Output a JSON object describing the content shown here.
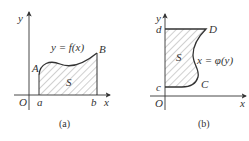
{
  "panel_a": {
    "caption": "(a)",
    "origin_label": "O",
    "x_axis_label": "x",
    "y_axis_label": "y",
    "point_a_label": "a",
    "point_b_label": "b",
    "curve_start_label": "A",
    "curve_end_label": "B",
    "function_label": "y = f(x)",
    "region_label": "S"
  },
  "panel_b": {
    "caption": "(b)",
    "origin_label": "O",
    "x_axis_label": "x",
    "y_axis_label": "y",
    "point_c_label": "c",
    "point_d_label": "d",
    "curve_start_label": "C",
    "curve_end_label": "D",
    "function_label": "x = φ(y)",
    "region_label": "S"
  },
  "colors": {
    "ink": "#333333",
    "hatch": "#7a7a7a"
  }
}
